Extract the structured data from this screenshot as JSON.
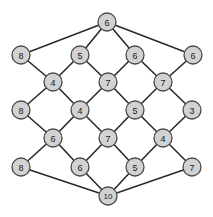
{
  "figure": {
    "background_color": "#ffffff",
    "node_fill_color": "#d2d2d2",
    "node_stroke_color": "#4a4a4a",
    "edge_color": "#2b2b2b",
    "label_color": "#1a1a1a",
    "node_radius": 9,
    "width": 213,
    "height": 217
  },
  "graph_data": {
    "type": "node-link-diagram",
    "layout": "diamond-lattice",
    "node_count": 24,
    "edge_count": 42,
    "rows": [
      {
        "index": 0,
        "y": 22,
        "count": 1,
        "labels": [
          "6"
        ]
      },
      {
        "index": 1,
        "y": 55,
        "count": 4,
        "labels": [
          "8",
          "5",
          "6",
          "6"
        ]
      },
      {
        "index": 2,
        "y": 82,
        "count": 3,
        "labels": [
          "4",
          "7",
          "7"
        ]
      },
      {
        "index": 3,
        "y": 110,
        "count": 4,
        "labels": [
          "8",
          "4",
          "5",
          "3"
        ]
      },
      {
        "index": 4,
        "y": 138,
        "count": 3,
        "labels": [
          "6",
          "7",
          "4"
        ]
      },
      {
        "index": 5,
        "y": 167,
        "count": 4,
        "labels": [
          "8",
          "6",
          "5",
          "7"
        ]
      },
      {
        "index": 6,
        "y": 196,
        "count": 1,
        "labels": [
          "10"
        ]
      }
    ],
    "nodes": [
      {
        "id": "n0",
        "label": "6",
        "x": 107,
        "y": 22,
        "row": 0,
        "col": 0
      },
      {
        "id": "n1",
        "label": "8",
        "x": 21,
        "y": 55,
        "row": 1,
        "col": 0
      },
      {
        "id": "n2",
        "label": "5",
        "x": 80,
        "y": 55,
        "row": 1,
        "col": 1
      },
      {
        "id": "n3",
        "label": "6",
        "x": 135,
        "y": 55,
        "row": 1,
        "col": 2
      },
      {
        "id": "n4",
        "label": "6",
        "x": 193,
        "y": 55,
        "row": 1,
        "col": 3
      },
      {
        "id": "n5",
        "label": "4",
        "x": 53,
        "y": 82,
        "row": 2,
        "col": 0
      },
      {
        "id": "n6",
        "label": "7",
        "x": 108,
        "y": 82,
        "row": 2,
        "col": 1
      },
      {
        "id": "n7",
        "label": "7",
        "x": 163,
        "y": 82,
        "row": 2,
        "col": 2
      },
      {
        "id": "n8",
        "label": "8",
        "x": 21,
        "y": 110,
        "row": 3,
        "col": 0
      },
      {
        "id": "n9",
        "label": "4",
        "x": 80,
        "y": 110,
        "row": 3,
        "col": 1
      },
      {
        "id": "n10",
        "label": "5",
        "x": 135,
        "y": 110,
        "row": 3,
        "col": 2
      },
      {
        "id": "n11",
        "label": "3",
        "x": 192,
        "y": 110,
        "row": 3,
        "col": 3
      },
      {
        "id": "n12",
        "label": "6",
        "x": 53,
        "y": 138,
        "row": 4,
        "col": 0
      },
      {
        "id": "n13",
        "label": "7",
        "x": 108,
        "y": 138,
        "row": 4,
        "col": 1
      },
      {
        "id": "n14",
        "label": "4",
        "x": 163,
        "y": 138,
        "row": 4,
        "col": 2
      },
      {
        "id": "n15",
        "label": "8",
        "x": 21,
        "y": 167,
        "row": 5,
        "col": 0
      },
      {
        "id": "n16",
        "label": "6",
        "x": 80,
        "y": 167,
        "row": 5,
        "col": 1
      },
      {
        "id": "n17",
        "label": "5",
        "x": 135,
        "y": 167,
        "row": 5,
        "col": 2
      },
      {
        "id": "n18",
        "label": "7",
        "x": 192,
        "y": 167,
        "row": 5,
        "col": 3
      },
      {
        "id": "n19",
        "label": "10",
        "x": 108,
        "y": 196,
        "row": 6,
        "col": 0
      }
    ],
    "edges": [
      [
        "n0",
        "n1"
      ],
      [
        "n0",
        "n2"
      ],
      [
        "n0",
        "n3"
      ],
      [
        "n0",
        "n4"
      ],
      [
        "n1",
        "n5"
      ],
      [
        "n2",
        "n5"
      ],
      [
        "n2",
        "n6"
      ],
      [
        "n3",
        "n6"
      ],
      [
        "n3",
        "n7"
      ],
      [
        "n4",
        "n7"
      ],
      [
        "n5",
        "n8"
      ],
      [
        "n5",
        "n9"
      ],
      [
        "n6",
        "n9"
      ],
      [
        "n6",
        "n10"
      ],
      [
        "n7",
        "n10"
      ],
      [
        "n7",
        "n11"
      ],
      [
        "n8",
        "n12"
      ],
      [
        "n9",
        "n12"
      ],
      [
        "n9",
        "n13"
      ],
      [
        "n10",
        "n13"
      ],
      [
        "n10",
        "n14"
      ],
      [
        "n11",
        "n14"
      ],
      [
        "n12",
        "n15"
      ],
      [
        "n12",
        "n16"
      ],
      [
        "n13",
        "n16"
      ],
      [
        "n13",
        "n17"
      ],
      [
        "n14",
        "n17"
      ],
      [
        "n14",
        "n18"
      ],
      [
        "n15",
        "n19"
      ],
      [
        "n16",
        "n19"
      ],
      [
        "n17",
        "n19"
      ],
      [
        "n18",
        "n19"
      ]
    ]
  }
}
